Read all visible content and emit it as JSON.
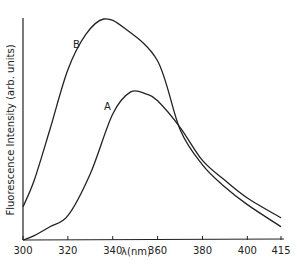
{
  "chart_data": {
    "type": "line",
    "title": "",
    "xlabel": "λ(nm)",
    "ylabel": "Fluorescence Intensity (arb. units)",
    "xlim": [
      300,
      415
    ],
    "ylim": [
      0,
      100
    ],
    "x_ticks": [
      "300",
      "320",
      "340",
      "360",
      "380",
      "400",
      "415"
    ],
    "grid": false,
    "series": [
      {
        "name": "B",
        "x": [
          300,
          305,
          312,
          320,
          328,
          336,
          345,
          360,
          370,
          380,
          390,
          400,
          415
        ],
        "values": [
          15,
          27,
          50,
          77,
          93,
          100,
          96,
          81,
          50,
          34,
          24,
          16,
          6
        ]
      },
      {
        "name": "A",
        "x": [
          300,
          305,
          312,
          320,
          330,
          340,
          348,
          355,
          360,
          370,
          380,
          390,
          400,
          415
        ],
        "values": [
          0,
          2,
          6,
          11,
          30,
          57,
          67,
          66,
          63,
          51,
          36,
          27,
          19,
          10
        ]
      }
    ]
  }
}
